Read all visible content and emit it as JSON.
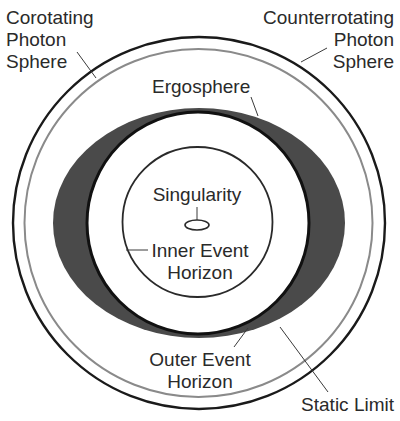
{
  "diagram": {
    "colors": {
      "background": "#ffffff",
      "line": "#1a1a1a",
      "photon_sphere_inner": "#8a8a8a",
      "ergosphere_fill": "#4a4a4a",
      "text": "#2a2a2a"
    },
    "labels": {
      "corotating_photon_sphere": [
        "Corotating",
        "Photon",
        "Sphere"
      ],
      "counterrotating_photon_sphere": [
        "Counterrotating",
        "Photon",
        "Sphere"
      ],
      "ergosphere": "Ergosphere",
      "singularity": "Singularity",
      "inner_event_horizon": [
        "Inner Event",
        "Horizon"
      ],
      "outer_event_horizon": [
        "Outer Event",
        "Horizon"
      ],
      "static_limit": "Static Limit"
    }
  }
}
